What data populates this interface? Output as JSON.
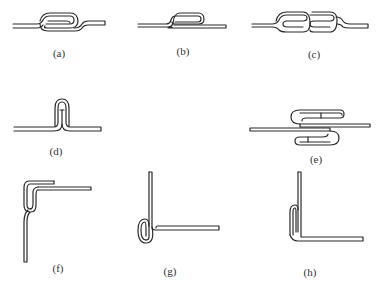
{
  "diagram": {
    "panels": [
      {
        "id": "a",
        "label": "(a)"
      },
      {
        "id": "b",
        "label": "(b)"
      },
      {
        "id": "c",
        "label": "(c)"
      },
      {
        "id": "d",
        "label": "(d)"
      },
      {
        "id": "e",
        "label": "(e)"
      },
      {
        "id": "f",
        "label": "(f)"
      },
      {
        "id": "g",
        "label": "(g)"
      },
      {
        "id": "h",
        "label": "(h)"
      }
    ],
    "colors": {
      "stroke": "#2a2a2a",
      "background": "#ffffff"
    }
  }
}
